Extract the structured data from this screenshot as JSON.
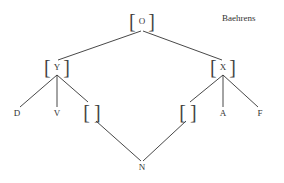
{
  "title": "Baehrens",
  "nodes": {
    "O": {
      "label": "O",
      "bracketed": true
    },
    "Y": {
      "label": "Y",
      "bracketed": true
    },
    "X": {
      "label": "X",
      "bracketed": true
    },
    "L": {
      "label": "",
      "bracketed": true
    },
    "R": {
      "label": "",
      "bracketed": true
    },
    "D": {
      "label": "D"
    },
    "V": {
      "label": "V"
    },
    "A": {
      "label": "A"
    },
    "F": {
      "label": "F"
    },
    "N": {
      "label": "N"
    }
  },
  "brackets": {
    "open": "[",
    "close": "]"
  },
  "edges": [
    [
      "O",
      "Y"
    ],
    [
      "O",
      "X"
    ],
    [
      "Y",
      "D"
    ],
    [
      "Y",
      "V"
    ],
    [
      "Y",
      "L"
    ],
    [
      "X",
      "R"
    ],
    [
      "X",
      "A"
    ],
    [
      "X",
      "F"
    ],
    [
      "L",
      "N"
    ],
    [
      "R",
      "N"
    ]
  ]
}
